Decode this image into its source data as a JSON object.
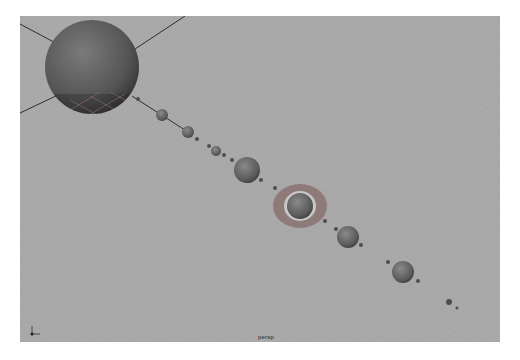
{
  "viewport": {
    "camera_label": "persp",
    "background_color": "#a9a9a9",
    "axis_gizmo": {
      "labels": [
        "y",
        "x"
      ]
    }
  },
  "scene": {
    "description": "Solar system model in 3D perspective viewport",
    "sun": {
      "cx": 72,
      "cy": 51,
      "r": 47
    },
    "bodies": [
      {
        "cx": 118,
        "cy": 83,
        "r": 2
      },
      {
        "cx": 142,
        "cy": 99,
        "r": 6
      },
      {
        "cx": 168,
        "cy": 116,
        "r": 6
      },
      {
        "cx": 177,
        "cy": 123,
        "r": 2
      },
      {
        "cx": 189,
        "cy": 130,
        "r": 2
      },
      {
        "cx": 196,
        "cy": 135,
        "r": 5
      },
      {
        "cx": 204,
        "cy": 139,
        "r": 2
      },
      {
        "cx": 212,
        "cy": 144,
        "r": 2
      },
      {
        "cx": 227,
        "cy": 154,
        "r": 13
      },
      {
        "cx": 241,
        "cy": 164,
        "r": 2
      },
      {
        "cx": 255,
        "cy": 172,
        "r": 2
      },
      {
        "cx": 280,
        "cy": 190,
        "r": 13
      },
      {
        "cx": 305,
        "cy": 205,
        "r": 2
      },
      {
        "cx": 316,
        "cy": 213,
        "r": 2
      },
      {
        "cx": 328,
        "cy": 221,
        "r": 11
      },
      {
        "cx": 341,
        "cy": 229,
        "r": 2
      },
      {
        "cx": 368,
        "cy": 246,
        "r": 2
      },
      {
        "cx": 383,
        "cy": 256,
        "r": 11
      },
      {
        "cx": 398,
        "cy": 265,
        "r": 2
      },
      {
        "cx": 429,
        "cy": 286,
        "r": 3
      },
      {
        "cx": 437,
        "cy": 292,
        "r": 1.5
      }
    ],
    "ring": {
      "cx": 280,
      "cy": 190,
      "rx": 27,
      "ry": 22
    }
  }
}
